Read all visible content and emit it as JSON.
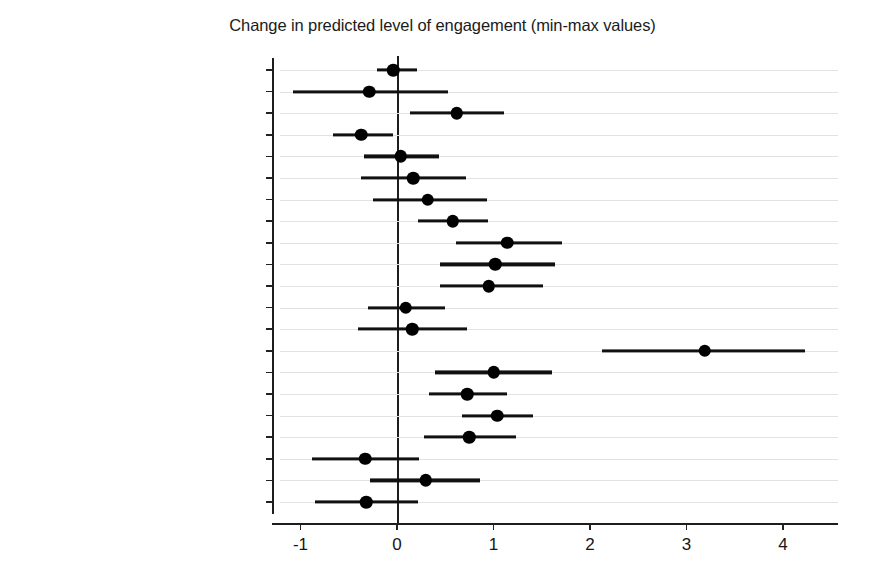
{
  "chart_data": {
    "type": "scatter",
    "title": "Change in predicted level of engagement (min-max values)",
    "xlabel": "",
    "ylabel": "",
    "xlim": [
      -1.35,
      4.7
    ],
    "xticks": [
      -1,
      0,
      1,
      2,
      3,
      4
    ],
    "xticklabels": [
      "-1",
      "0",
      "1",
      "2",
      "3",
      "4"
    ],
    "grid": true,
    "grid_axis": "y",
    "legend": "none",
    "reference_line_x": 0,
    "categories": [
      "Female",
      "Education",
      "Family income",
      "Black",
      "Latinx",
      "Asian",
      "Multiracial",
      "LGBTQ",
      "Follows politics",
      "Understands politics",
      "Politics meets needs (Dis)",
      "Strong partisan",
      "Ideology (Cons to Lib)",
      "High school activity level",
      "Number of critical issues",
      "Party contact",
      "Campaign contact",
      "Political group contact",
      "Positive emotions scale",
      "Negative emotions scale",
      "Church attendance"
    ],
    "values": [
      -0.04,
      -0.29,
      0.62,
      -0.37,
      0.04,
      0.17,
      0.32,
      0.58,
      1.14,
      1.02,
      0.95,
      0.09,
      0.16,
      3.19,
      1.0,
      0.73,
      1.04,
      0.75,
      -0.33,
      0.3,
      -0.32
    ],
    "ci_low": [
      -0.21,
      -1.08,
      0.13,
      -0.66,
      -0.34,
      -0.37,
      -0.25,
      0.22,
      0.61,
      0.45,
      0.45,
      -0.3,
      -0.4,
      2.12,
      0.39,
      0.33,
      0.67,
      0.28,
      -0.88,
      -0.28,
      -0.85
    ],
    "ci_high": [
      0.21,
      0.53,
      1.11,
      -0.04,
      0.44,
      0.72,
      0.93,
      0.94,
      1.71,
      1.64,
      1.51,
      0.5,
      0.73,
      4.23,
      1.61,
      1.14,
      1.41,
      1.23,
      0.23,
      0.86,
      0.22
    ],
    "point_color": "#000000",
    "ci_color": "#111111",
    "grid_color": "#e2e2e2"
  }
}
